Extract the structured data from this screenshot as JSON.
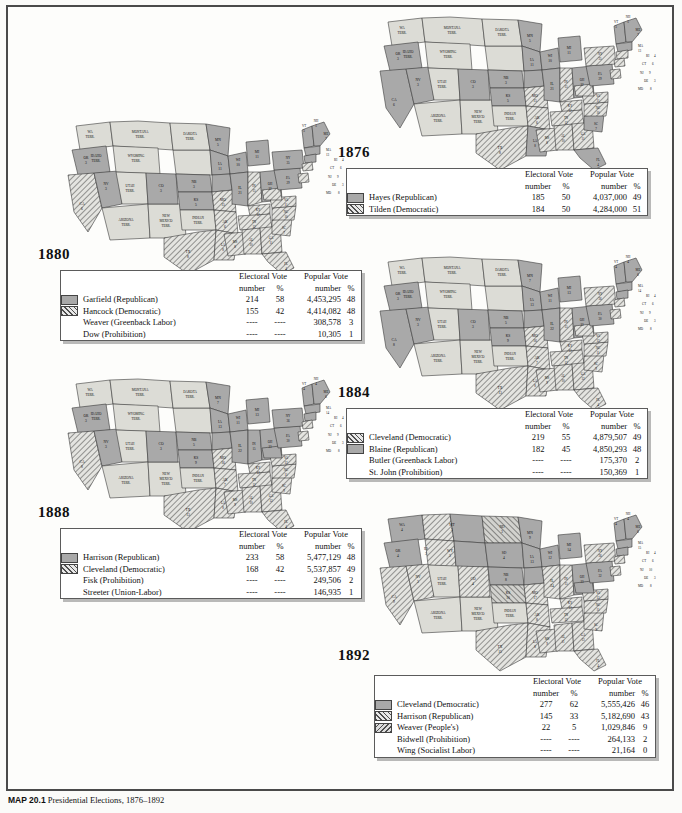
{
  "page": {
    "caption_label": "MAP 20.1",
    "caption_text": "Presidential Elections, 1876–1892",
    "border_color": "#4a4a4a"
  },
  "legend_columns": {
    "electoral_group": "Electoral Vote",
    "popular_group": "Popular Vote",
    "number": "number",
    "percent": "%"
  },
  "swatch_styles": {
    "republican": "solid",
    "democratic": "hatch",
    "third_party": "hatch2",
    "none": "none"
  },
  "elections": [
    {
      "id": "1876",
      "year": "1876",
      "rows": [
        {
          "swatch": "solid",
          "candidate": "Hayes (Republican)",
          "ev_number": "185",
          "ev_pct": "50",
          "pop_number": "4,037,000",
          "pop_pct": "49"
        },
        {
          "swatch": "hatch",
          "candidate": "Tilden (Democratic)",
          "ev_number": "184",
          "ev_pct": "50",
          "pop_number": "4,284,000",
          "pop_pct": "51"
        }
      ]
    },
    {
      "id": "1880",
      "year": "1880",
      "rows": [
        {
          "swatch": "solid",
          "candidate": "Garfield (Republican)",
          "ev_number": "214",
          "ev_pct": "58",
          "pop_number": "4,453,295",
          "pop_pct": "48"
        },
        {
          "swatch": "hatch",
          "candidate": "Hancock (Democratic)",
          "ev_number": "155",
          "ev_pct": "42",
          "pop_number": "4,414,082",
          "pop_pct": "48"
        },
        {
          "swatch": "none",
          "candidate": "Weaver (Greenback Labor)",
          "ev_number": "----",
          "ev_pct": "----",
          "pop_number": "308,578",
          "pop_pct": "3"
        },
        {
          "swatch": "none",
          "candidate": "Dow (Prohibition)",
          "ev_number": "----",
          "ev_pct": "----",
          "pop_number": "10,305",
          "pop_pct": "1"
        }
      ]
    },
    {
      "id": "1884",
      "year": "1884",
      "rows": [
        {
          "swatch": "hatch",
          "candidate": "Cleveland (Democratic)",
          "ev_number": "219",
          "ev_pct": "55",
          "pop_number": "4,879,507",
          "pop_pct": "49"
        },
        {
          "swatch": "solid",
          "candidate": "Blaine (Republican)",
          "ev_number": "182",
          "ev_pct": "45",
          "pop_number": "4,850,293",
          "pop_pct": "48"
        },
        {
          "swatch": "none",
          "candidate": "Butler (Greenback Labor)",
          "ev_number": "----",
          "ev_pct": "----",
          "pop_number": "175,370",
          "pop_pct": "2"
        },
        {
          "swatch": "none",
          "candidate": "St. John (Prohibition)",
          "ev_number": "----",
          "ev_pct": "----",
          "pop_number": "150,369",
          "pop_pct": "1"
        }
      ]
    },
    {
      "id": "1888",
      "year": "1888",
      "rows": [
        {
          "swatch": "solid",
          "candidate": "Harrison (Republican)",
          "ev_number": "233",
          "ev_pct": "58",
          "pop_number": "5,477,129",
          "pop_pct": "48"
        },
        {
          "swatch": "hatch",
          "candidate": "Cleveland (Democratic)",
          "ev_number": "168",
          "ev_pct": "42",
          "pop_number": "5,537,857",
          "pop_pct": "49"
        },
        {
          "swatch": "none",
          "candidate": "Fisk (Prohibition)",
          "ev_number": "----",
          "ev_pct": "----",
          "pop_number": "249,506",
          "pop_pct": "2"
        },
        {
          "swatch": "none",
          "candidate": "Streeter (Union-Labor)",
          "ev_number": "----",
          "ev_pct": "----",
          "pop_number": "146,935",
          "pop_pct": "1"
        }
      ]
    },
    {
      "id": "1892",
      "year": "1892",
      "rows": [
        {
          "swatch": "solid",
          "candidate": "Cleveland (Democratic)",
          "ev_number": "277",
          "ev_pct": "62",
          "pop_number": "5,555,426",
          "pop_pct": "46"
        },
        {
          "swatch": "hatch",
          "candidate": "Harrison (Republican)",
          "ev_number": "145",
          "ev_pct": "33",
          "pop_number": "5,182,690",
          "pop_pct": "43"
        },
        {
          "swatch": "hatch2",
          "candidate": "Weaver (People's)",
          "ev_number": "22",
          "ev_pct": "5",
          "pop_number": "1,029,846",
          "pop_pct": "9"
        },
        {
          "swatch": "none",
          "candidate": "Bidwell (Prohibition)",
          "ev_number": "----",
          "ev_pct": "----",
          "pop_number": "264,133",
          "pop_pct": "2"
        },
        {
          "swatch": "none",
          "candidate": "Wing (Socialist Labor)",
          "ev_number": "----",
          "ev_pct": "----",
          "pop_number": "21,164",
          "pop_pct": "0"
        }
      ]
    }
  ],
  "maps": {
    "1876": {
      "states": [
        {
          "code": "WA\nTERR.",
          "cls": "terr",
          "x": 30,
          "y": 22
        },
        {
          "code": "OR",
          "ev": "3",
          "cls": "rep",
          "x": 26,
          "y": 48
        },
        {
          "code": "CA",
          "ev": "6",
          "cls": "rep",
          "x": 22,
          "y": 95
        },
        {
          "code": "NV",
          "ev": "3",
          "cls": "rep",
          "x": 46,
          "y": 72
        },
        {
          "code": "IDAHO\nTERR.",
          "cls": "terr",
          "x": 52,
          "y": 40
        },
        {
          "code": "MONTANA\nTERR.",
          "cls": "terr",
          "x": 84,
          "y": 27
        },
        {
          "code": "WYOMING\nTERR.",
          "cls": "terr",
          "x": 83,
          "y": 55
        },
        {
          "code": "UTAH\nTERR.",
          "cls": "terr",
          "x": 59,
          "y": 80
        },
        {
          "code": "ARIZONA\nTERR.",
          "cls": "terr",
          "x": 60,
          "y": 112
        },
        {
          "code": "NEW\nMEXICO\nTERR.",
          "cls": "terr",
          "x": 92,
          "y": 112
        },
        {
          "code": "CO",
          "ev": "3",
          "cls": "rep",
          "x": 92,
          "y": 82
        },
        {
          "code": "DAKOTA\nTERR.",
          "cls": "terr",
          "x": 123,
          "y": 32
        },
        {
          "code": "NB",
          "ev": "3",
          "cls": "rep",
          "x": 124,
          "y": 67
        },
        {
          "code": "KS",
          "ev": "5",
          "cls": "rep",
          "x": 126,
          "y": 88
        },
        {
          "code": "INDIAN\nTERR.",
          "cls": "terr",
          "x": 130,
          "y": 108
        },
        {
          "code": "TX",
          "ev": "8",
          "cls": "dem",
          "x": 122,
          "y": 140
        },
        {
          "code": "MN",
          "ev": "5",
          "cls": "rep",
          "x": 152,
          "y": 33
        },
        {
          "code": "IA",
          "ev": "11",
          "cls": "rep",
          "x": 155,
          "y": 66
        },
        {
          "code": "MO",
          "ev": "15",
          "cls": "dem",
          "x": 157,
          "y": 90
        },
        {
          "code": "AR",
          "ev": "6",
          "cls": "dem",
          "x": 156,
          "y": 113
        },
        {
          "code": "LA",
          "ev": "8",
          "cls": "rep",
          "x": 160,
          "y": 136
        },
        {
          "code": "WI",
          "ev": "10",
          "cls": "rep",
          "x": 176,
          "y": 46
        },
        {
          "code": "IL",
          "ev": "21",
          "cls": "rep",
          "x": 176,
          "y": 78
        },
        {
          "code": "MS",
          "ev": "8",
          "cls": "dem",
          "x": 176,
          "y": 125
        },
        {
          "code": "MI",
          "ev": "11",
          "cls": "rep",
          "x": 196,
          "y": 42
        },
        {
          "code": "IN",
          "ev": "15",
          "cls": "dem",
          "x": 192,
          "y": 82
        },
        {
          "code": "KY",
          "ev": "12",
          "cls": "dem",
          "x": 194,
          "y": 98
        },
        {
          "code": "TN",
          "ev": "12",
          "cls": "dem",
          "x": 196,
          "y": 110
        },
        {
          "code": "AL",
          "ev": "10",
          "cls": "dem",
          "x": 191,
          "y": 127
        },
        {
          "code": "OH",
          "ev": "22",
          "cls": "rep",
          "x": 208,
          "y": 78
        },
        {
          "code": "GA",
          "ev": "11",
          "cls": "dem",
          "x": 208,
          "y": 127
        },
        {
          "code": "FL",
          "ev": "4",
          "cls": "rep",
          "x": 222,
          "y": 150
        },
        {
          "code": "SC",
          "ev": "7",
          "cls": "rep",
          "x": 219,
          "y": 116
        },
        {
          "code": "NC",
          "ev": "10",
          "cls": "dem",
          "x": 222,
          "y": 105
        },
        {
          "code": "VA",
          "ev": "11",
          "cls": "dem",
          "x": 222,
          "y": 93
        },
        {
          "code": "WV",
          "ev": "5",
          "cls": "dem",
          "x": 212,
          "y": 88
        },
        {
          "code": "PA",
          "ev": "29",
          "cls": "rep",
          "x": 225,
          "y": 70
        },
        {
          "code": "NY",
          "ev": "35",
          "cls": "dem",
          "x": 228,
          "y": 52
        }
      ],
      "callouts": [
        {
          "text": "VT",
          "num": "5",
          "x": 246,
          "y": 12
        },
        {
          "text": "NH",
          "num": "5",
          "x": 258,
          "y": 9
        },
        {
          "text": "ME",
          "num": "7",
          "x": 268,
          "y": 18
        },
        {
          "text": "MA",
          "num": "13",
          "x": 268,
          "y": 32
        },
        {
          "text": "RI",
          "num": "4",
          "x": 272,
          "y": 43
        },
        {
          "text": "CT",
          "num": "6",
          "x": 268,
          "y": 51
        },
        {
          "text": "NJ",
          "num": "9",
          "x": 266,
          "y": 60
        },
        {
          "text": "DE",
          "num": "3",
          "x": 270,
          "y": 68
        },
        {
          "text": "MD",
          "num": "8",
          "x": 266,
          "y": 77
        }
      ]
    }
  },
  "map_notes": {
    "territory_fill": "#dcdcd6",
    "republican_fill": "#a9a9a9",
    "democratic_fill": "diagonal-hatch",
    "peoples_fill": "reverse-diagonal-hatch"
  }
}
